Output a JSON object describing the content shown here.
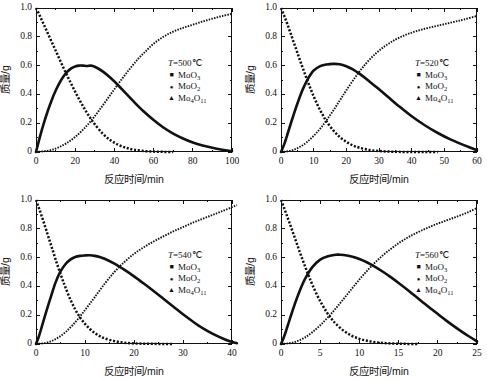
{
  "figure": {
    "type": "multi-panel-line-chart",
    "panels": 4,
    "background": "#ffffff",
    "ink_color": "#111111"
  },
  "axis_labels": {
    "x": "反应时间/min",
    "y": "质量/g"
  },
  "legend_series": [
    {
      "name": "MoO3",
      "label_main": "MoO",
      "label_sub": "3",
      "marker": "square"
    },
    {
      "name": "MoO2",
      "label_main": "MoO",
      "label_sub": "2",
      "marker": "dot"
    },
    {
      "name": "Mo4O11",
      "label_main": "Mo",
      "label_sub": "4",
      "label_main2": "O",
      "label_sub2": "11",
      "marker": "triangle"
    }
  ],
  "chart_data": [
    {
      "type": "line",
      "panel": "top-left",
      "title": "T=500℃",
      "temperature_label": "T",
      "temperature_value": "=500℃",
      "xlabel": "反应时间/min",
      "ylabel": "质量/g",
      "xlim": [
        0,
        100
      ],
      "ylim": [
        0,
        1.0
      ],
      "xticks": [
        0,
        20,
        40,
        60,
        80,
        100
      ],
      "yticks": [
        "0",
        "0.2",
        "0.4",
        "0.6",
        "0.8",
        "1.0"
      ],
      "xminor": 2,
      "yminor": 2,
      "grid": false,
      "legend_position": "center-right",
      "series": [
        {
          "name": "MoO3",
          "style": "dotted-square",
          "peak": null,
          "x": [
            0,
            2,
            4,
            6,
            8,
            10,
            12,
            14,
            16,
            18,
            20,
            22,
            24,
            26,
            28,
            30,
            34,
            38,
            42,
            46,
            50,
            55,
            60,
            65,
            70
          ],
          "y": [
            1.0,
            0.945,
            0.885,
            0.825,
            0.765,
            0.705,
            0.645,
            0.585,
            0.528,
            0.472,
            0.418,
            0.366,
            0.318,
            0.272,
            0.23,
            0.192,
            0.128,
            0.082,
            0.05,
            0.029,
            0.016,
            0.007,
            0.003,
            0.001,
            0.0
          ]
        },
        {
          "name": "MoO2",
          "style": "solid-thick",
          "peak": {
            "x": 28,
            "y": 0.6
          },
          "x": [
            0,
            2,
            4,
            6,
            8,
            10,
            12,
            14,
            16,
            18,
            20,
            22,
            24,
            26,
            28,
            30,
            34,
            38,
            42,
            46,
            50,
            55,
            60,
            65,
            70,
            75,
            80,
            85,
            90,
            95,
            100
          ],
          "y": [
            0.0,
            0.105,
            0.2,
            0.285,
            0.36,
            0.425,
            0.48,
            0.524,
            0.558,
            0.581,
            0.594,
            0.6,
            0.6,
            0.597,
            0.6,
            0.592,
            0.56,
            0.515,
            0.462,
            0.405,
            0.348,
            0.281,
            0.222,
            0.17,
            0.128,
            0.094,
            0.066,
            0.045,
            0.029,
            0.016,
            0.005
          ]
        },
        {
          "name": "Mo4O11",
          "style": "dotted-fine",
          "peak": null,
          "x": [
            0,
            4,
            8,
            12,
            16,
            20,
            24,
            28,
            32,
            36,
            40,
            44,
            48,
            52,
            56,
            60,
            65,
            70,
            75,
            80,
            85,
            90,
            95,
            100
          ],
          "y": [
            0.0,
            0.005,
            0.015,
            0.035,
            0.065,
            0.105,
            0.155,
            0.215,
            0.285,
            0.36,
            0.436,
            0.51,
            0.58,
            0.645,
            0.7,
            0.752,
            0.8,
            0.836,
            0.862,
            0.884,
            0.906,
            0.926,
            0.944,
            0.96
          ]
        }
      ]
    },
    {
      "type": "line",
      "panel": "top-right",
      "title": "T=520℃",
      "temperature_label": "T",
      "temperature_value": "=520℃",
      "xlabel": "反应时间/min",
      "ylabel": "质量/g",
      "xlim": [
        0,
        60
      ],
      "ylim": [
        0,
        1.0
      ],
      "xticks": [
        0,
        10,
        20,
        30,
        40,
        50,
        60
      ],
      "yticks": [
        "0",
        "0.2",
        "0.4",
        "0.6",
        "0.8",
        "1.0"
      ],
      "xminor": 2,
      "yminor": 2,
      "grid": false,
      "legend_position": "center-right",
      "series": [
        {
          "name": "MoO3",
          "style": "dotted-square",
          "peak": null,
          "x": [
            0,
            1,
            2,
            3,
            4,
            5,
            6,
            7,
            8,
            9,
            10,
            11,
            12,
            13,
            14,
            16,
            18,
            20,
            22,
            24,
            27,
            30,
            33,
            36,
            40,
            44,
            48
          ],
          "y": [
            1.0,
            0.945,
            0.885,
            0.82,
            0.755,
            0.69,
            0.625,
            0.562,
            0.5,
            0.442,
            0.386,
            0.336,
            0.29,
            0.248,
            0.21,
            0.15,
            0.104,
            0.07,
            0.046,
            0.03,
            0.014,
            0.007,
            0.003,
            0.001,
            0.0,
            0.0,
            0.0
          ]
        },
        {
          "name": "MoO2",
          "style": "solid-thick",
          "peak": {
            "x": 18,
            "y": 0.61
          },
          "x": [
            0,
            1,
            2,
            3,
            4,
            5,
            6,
            7,
            8,
            9,
            10,
            12,
            14,
            16,
            18,
            20,
            22,
            24,
            27,
            30,
            33,
            36,
            40,
            44,
            48,
            52,
            56,
            60
          ],
          "y": [
            0.0,
            0.055,
            0.125,
            0.198,
            0.268,
            0.335,
            0.398,
            0.452,
            0.498,
            0.536,
            0.566,
            0.596,
            0.608,
            0.612,
            0.61,
            0.596,
            0.574,
            0.544,
            0.492,
            0.436,
            0.378,
            0.32,
            0.248,
            0.186,
            0.132,
            0.086,
            0.048,
            0.012
          ]
        },
        {
          "name": "Mo4O11",
          "style": "dotted-fine",
          "peak": null,
          "x": [
            0,
            2,
            4,
            6,
            8,
            10,
            12,
            14,
            16,
            18,
            20,
            23,
            26,
            29,
            32,
            35,
            38,
            41,
            44,
            47,
            50,
            53,
            56,
            60
          ],
          "y": [
            0.0,
            0.005,
            0.016,
            0.038,
            0.07,
            0.112,
            0.162,
            0.222,
            0.288,
            0.358,
            0.428,
            0.528,
            0.614,
            0.684,
            0.738,
            0.78,
            0.812,
            0.836,
            0.856,
            0.872,
            0.888,
            0.904,
            0.92,
            0.945
          ]
        }
      ]
    },
    {
      "type": "line",
      "panel": "bottom-left",
      "title": "T=540℃",
      "temperature_label": "T",
      "temperature_value": "=540℃",
      "xlabel": "反应时间/min",
      "ylabel": "质量/g",
      "xlim": [
        0,
        40
      ],
      "ylim": [
        0,
        1.0
      ],
      "xticks": [
        0,
        10,
        20,
        30,
        40
      ],
      "yticks": [
        "0",
        "0.2",
        "0.4",
        "0.6",
        "0.8",
        "1.0"
      ],
      "xminor": 2,
      "yminor": 2,
      "grid": false,
      "legend_position": "center-right",
      "series": [
        {
          "name": "MoO3",
          "style": "dotted-square",
          "peak": null,
          "x": [
            0,
            0.6,
            1.2,
            1.8,
            2.4,
            3,
            3.6,
            4.2,
            4.8,
            5.4,
            6,
            7,
            8,
            9,
            10,
            11,
            12,
            13,
            14,
            16,
            18,
            20,
            22,
            24,
            26,
            28
          ],
          "y": [
            1.0,
            0.944,
            0.884,
            0.822,
            0.758,
            0.694,
            0.63,
            0.566,
            0.506,
            0.448,
            0.394,
            0.31,
            0.24,
            0.184,
            0.14,
            0.104,
            0.076,
            0.055,
            0.039,
            0.02,
            0.009,
            0.004,
            0.002,
            0.001,
            0.0,
            0.0
          ]
        },
        {
          "name": "MoO2",
          "style": "solid-thick",
          "peak": {
            "x": 11.5,
            "y": 0.615
          },
          "x": [
            0,
            0.6,
            1.2,
            1.8,
            2.4,
            3,
            4,
            5,
            6,
            7,
            8,
            9,
            10,
            11,
            12,
            13,
            14,
            16,
            18,
            20,
            22,
            24,
            26,
            28,
            30,
            32,
            34,
            36,
            38,
            40,
            41
          ],
          "y": [
            0.0,
            0.054,
            0.122,
            0.192,
            0.26,
            0.324,
            0.428,
            0.504,
            0.554,
            0.586,
            0.604,
            0.612,
            0.615,
            0.616,
            0.612,
            0.604,
            0.592,
            0.558,
            0.516,
            0.47,
            0.42,
            0.368,
            0.314,
            0.26,
            0.206,
            0.156,
            0.11,
            0.072,
            0.04,
            0.014,
            0.005
          ]
        },
        {
          "name": "Mo4O11",
          "style": "dotted-fine",
          "peak": null,
          "x": [
            0,
            1.5,
            3,
            4.5,
            6,
            7.5,
            9,
            10.5,
            12,
            14,
            16,
            18,
            20,
            22,
            24,
            26,
            28,
            30,
            32,
            34,
            36,
            38,
            40,
            41
          ],
          "y": [
            0.0,
            0.005,
            0.018,
            0.044,
            0.082,
            0.132,
            0.192,
            0.258,
            0.326,
            0.418,
            0.5,
            0.568,
            0.626,
            0.672,
            0.712,
            0.748,
            0.782,
            0.812,
            0.842,
            0.87,
            0.896,
            0.922,
            0.95,
            0.965
          ]
        }
      ]
    },
    {
      "type": "line",
      "panel": "bottom-right",
      "title": "T=560℃",
      "temperature_label": "T",
      "temperature_value": "=560℃",
      "xlabel": "反应时间/min",
      "ylabel": "质量/g",
      "xlim": [
        0,
        25
      ],
      "ylim": [
        0,
        1.0
      ],
      "xticks": [
        0,
        5,
        10,
        15,
        20,
        25
      ],
      "yticks": [
        "0",
        "0.2",
        "0.4",
        "0.6",
        "0.8",
        "1.0"
      ],
      "xminor": 2,
      "yminor": 2,
      "grid": false,
      "legend_position": "center-right",
      "series": [
        {
          "name": "MoO3",
          "style": "dotted-square",
          "peak": null,
          "x": [
            0,
            0.4,
            0.8,
            1.2,
            1.6,
            2,
            2.4,
            2.8,
            3.2,
            3.6,
            4,
            4.6,
            5.2,
            5.8,
            6.4,
            7,
            8,
            9,
            10,
            11,
            12,
            13,
            14,
            15,
            16,
            17,
            17.5
          ],
          "y": [
            1.0,
            0.944,
            0.884,
            0.824,
            0.762,
            0.7,
            0.638,
            0.578,
            0.52,
            0.464,
            0.412,
            0.34,
            0.278,
            0.224,
            0.178,
            0.14,
            0.092,
            0.058,
            0.036,
            0.022,
            0.013,
            0.007,
            0.004,
            0.002,
            0.001,
            0.0,
            0.0
          ]
        },
        {
          "name": "MoO2",
          "style": "solid-thick",
          "peak": {
            "x": 7.5,
            "y": 0.62
          },
          "x": [
            0,
            0.4,
            0.8,
            1.2,
            1.6,
            2,
            2.6,
            3.2,
            4,
            5,
            6,
            7,
            7.5,
            8,
            9,
            10,
            11,
            12,
            13,
            14,
            15,
            16,
            17,
            18,
            19,
            20,
            21,
            22,
            23,
            24,
            25
          ],
          "y": [
            0.0,
            0.052,
            0.118,
            0.186,
            0.252,
            0.314,
            0.398,
            0.466,
            0.534,
            0.586,
            0.61,
            0.62,
            0.62,
            0.618,
            0.608,
            0.59,
            0.566,
            0.536,
            0.502,
            0.464,
            0.424,
            0.382,
            0.338,
            0.294,
            0.25,
            0.208,
            0.166,
            0.126,
            0.088,
            0.052,
            0.018
          ]
        },
        {
          "name": "Mo4O11",
          "style": "dotted-fine",
          "peak": null,
          "x": [
            0,
            1,
            2,
            3,
            4,
            5,
            6,
            7,
            8,
            9,
            10,
            11,
            12,
            13,
            14,
            15,
            16,
            17,
            18,
            19,
            20,
            21,
            22,
            23,
            24,
            25
          ],
          "y": [
            0.0,
            0.005,
            0.018,
            0.044,
            0.082,
            0.13,
            0.186,
            0.248,
            0.314,
            0.382,
            0.448,
            0.51,
            0.566,
            0.616,
            0.66,
            0.7,
            0.734,
            0.764,
            0.79,
            0.814,
            0.836,
            0.856,
            0.876,
            0.896,
            0.918,
            0.945
          ]
        }
      ]
    }
  ]
}
